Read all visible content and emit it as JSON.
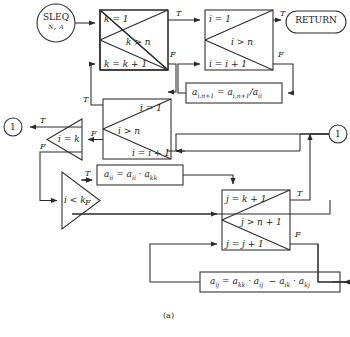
{
  "figure": {
    "caption": "(a)",
    "stroke_color": "#2b2b2b",
    "box_fill": "#ffffff"
  },
  "terminals": [
    {
      "id": "start",
      "name": "start-terminal",
      "shape": "circle",
      "line1": "SLEQ",
      "line2": "n, a"
    },
    {
      "id": "return",
      "name": "return-terminal",
      "shape": "stadium",
      "label": "RETURN"
    }
  ],
  "connectors": [
    {
      "id": "conn-left",
      "name": "connector-1-left",
      "label": "1"
    },
    {
      "id": "conn-right",
      "name": "connector-1-right",
      "label": "1"
    }
  ],
  "loop_boxes": [
    {
      "id": "k-loop",
      "name": "loop-box-k",
      "init": "k = 1",
      "test": "k > n",
      "incr": "k = k + 1",
      "true_label": "T",
      "false_label": "F"
    },
    {
      "id": "i-loop-top",
      "name": "loop-box-i-top",
      "init": "i = 1",
      "test": "i > n",
      "incr": "i = i + 1",
      "true_label": "T",
      "false_label": "F"
    },
    {
      "id": "i-loop-mid",
      "name": "loop-box-i-middle",
      "init": "i = 1",
      "test": "i > n",
      "incr": "i = i + 1",
      "true_label": "T",
      "false_label": "F"
    },
    {
      "id": "j-loop",
      "name": "loop-box-j",
      "init": "j = k + 1",
      "test": "j > n + 1",
      "incr": "j = j + 1",
      "true_label": "T",
      "false_label": "F"
    }
  ],
  "decisions": [
    {
      "id": "dec-ik",
      "name": "decision-i-equals-k",
      "test": "i = k",
      "true_label": "T",
      "false_label": "F",
      "direction": "left"
    },
    {
      "id": "dec-ilk",
      "name": "decision-i-less-than-k",
      "test": "i < k",
      "true_label": "T",
      "false_label": "F",
      "direction": "right"
    }
  ],
  "process_boxes": [
    {
      "id": "proc-divide",
      "name": "process-divide-pivot",
      "text": "a_{i,n+1} = a_{i,n+1} / a_{ii}",
      "html": "a<sub>i,n+1</sub> = a<sub>i,n+1</sub>/a<sub>ii</sub>"
    },
    {
      "id": "proc-diag",
      "name": "process-diagonal-product",
      "text": "a_{ii} = a_{ii} · a_{kk}",
      "html": "a<sub>ii</sub> = a<sub>ii</sub> · a<sub>kk</sub>"
    },
    {
      "id": "proc-update",
      "name": "process-element-update",
      "text": "a_{ij} = a_{kk} · a_{ij} − a_{ik} · a_{kj}",
      "html": "a<sub>ij</sub> = a<sub>kk</sub> · a<sub>ij</sub>  − a<sub>ik</sub> · a<sub>kj</sub>"
    }
  ]
}
